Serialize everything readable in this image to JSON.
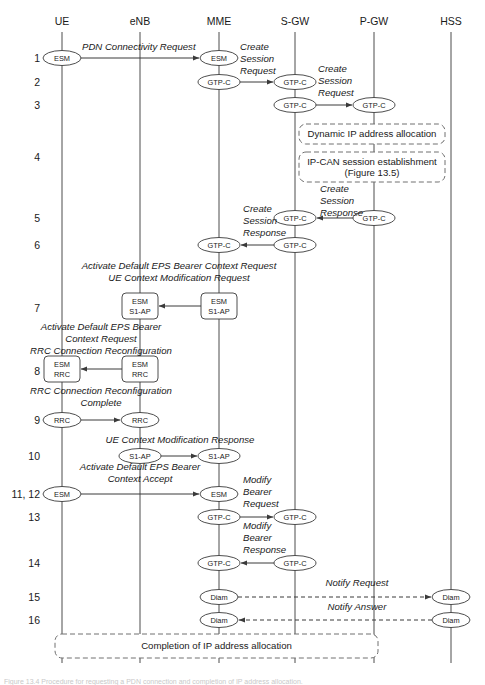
{
  "figure": {
    "caption": "Figure 13.4 Procedure for requesting a PDN connection and completion of IP address allocation.",
    "background_color": "#ffffff",
    "line_color": "#3a3a3a"
  },
  "actors": [
    {
      "id": "ue",
      "label": "UE",
      "x": 62
    },
    {
      "id": "enb",
      "label": "eNB",
      "x": 140
    },
    {
      "id": "mme",
      "label": "MME",
      "x": 219
    },
    {
      "id": "sgw",
      "label": "S-GW",
      "x": 295
    },
    {
      "id": "pgw",
      "label": "P-GW",
      "x": 374
    },
    {
      "id": "hss",
      "label": "HSS",
      "x": 451
    }
  ],
  "steps": [
    {
      "num": "1",
      "y": 58
    },
    {
      "num": "2",
      "y": 82
    },
    {
      "num": "3",
      "y": 105
    },
    {
      "num": "4",
      "y": 157
    },
    {
      "num": "5",
      "y": 218
    },
    {
      "num": "6",
      "y": 245
    },
    {
      "num": "7",
      "y": 308
    },
    {
      "num": "8",
      "y": 371
    },
    {
      "num": "9",
      "y": 420
    },
    {
      "num": "10",
      "y": 456
    },
    {
      "num": "11, 12",
      "y": 494
    },
    {
      "num": "13",
      "y": 517
    },
    {
      "num": "14",
      "y": 563
    },
    {
      "num": "15",
      "y": 597
    },
    {
      "num": "16",
      "y": 620
    }
  ],
  "messages": [
    {
      "id": "m1",
      "step": "1",
      "label": "PDN Connectivity Request",
      "label_lines": [
        "PDN Connectivity Request"
      ],
      "from": "ue",
      "to": "mme",
      "from_node": "ESM",
      "to_node": "ESM",
      "node_shape": "ellipse",
      "line": "solid",
      "direction": "right"
    },
    {
      "id": "m2",
      "step": "2",
      "label": "Create Session Request",
      "label_lines": [
        "Create",
        "Session",
        "Request"
      ],
      "from": "mme",
      "to": "sgw",
      "from_node": "GTP-C",
      "to_node": "GTP-C",
      "node_shape": "ellipse",
      "line": "solid",
      "direction": "right"
    },
    {
      "id": "m3",
      "step": "3",
      "label": "Create Session Request",
      "label_lines": [
        "Create",
        "Session",
        "Request"
      ],
      "from": "sgw",
      "to": "pgw",
      "from_node": "GTP-C",
      "to_node": "GTP-C",
      "node_shape": "ellipse",
      "line": "solid",
      "direction": "right"
    },
    {
      "id": "m5",
      "step": "5",
      "label": "Create Session Response",
      "label_lines": [
        "Create",
        "Session",
        "Response"
      ],
      "from": "pgw",
      "to": "sgw",
      "from_node": "GTP-C",
      "to_node": "GTP-C",
      "node_shape": "ellipse",
      "line": "solid",
      "direction": "left"
    },
    {
      "id": "m6",
      "step": "6",
      "label": "Create Session Response",
      "label_lines": [
        "Create",
        "Session",
        "Response"
      ],
      "from": "sgw",
      "to": "mme",
      "from_node": "GTP-C",
      "to_node": "GTP-C",
      "node_shape": "ellipse",
      "line": "solid",
      "direction": "left"
    },
    {
      "id": "m7",
      "step": "7",
      "label": "Activate Default EPS Bearer Context Request / UE Context Modification Request",
      "label_lines": [
        "Activate Default EPS Bearer Context Request",
        "UE Context Modification Request"
      ],
      "from": "mme",
      "to": "enb",
      "from_node": "ESM\nS1-AP",
      "to_node": "ESM\nS1-AP",
      "node_shape": "rounded-rect",
      "line": "solid",
      "direction": "left"
    },
    {
      "id": "m8",
      "step": "8",
      "label": "Activate Default EPS Bearer Context Request / RRC Connection Reconfiguration",
      "label_lines": [
        "Activate Default EPS Bearer",
        "Context Request",
        "RRC Connection Reconfiguration"
      ],
      "from": "enb",
      "to": "ue",
      "from_node": "ESM\nRRC",
      "to_node": "ESM\nRRC",
      "node_shape": "rounded-rect",
      "line": "solid",
      "direction": "left"
    },
    {
      "id": "m9",
      "step": "9",
      "label": "RRC Connection Reconfiguration Complete",
      "label_lines": [
        "RRC Connection Reconfiguration",
        "Complete"
      ],
      "from": "ue",
      "to": "enb",
      "from_node": "RRC",
      "to_node": "RRC",
      "node_shape": "ellipse",
      "line": "solid",
      "direction": "right"
    },
    {
      "id": "m10",
      "step": "10",
      "label": "UE Context Modification Response",
      "label_lines": [
        "UE Context Modification Response"
      ],
      "from": "enb",
      "to": "mme",
      "from_node": "S1-AP",
      "to_node": "S1-AP",
      "node_shape": "ellipse",
      "line": "solid",
      "direction": "right"
    },
    {
      "id": "m11",
      "step": "11, 12",
      "label": "Activate Default EPS Bearer Context Accept",
      "label_lines": [
        "Activate Default EPS Bearer",
        "Context Accept"
      ],
      "from": "ue",
      "to": "mme",
      "from_node": "ESM",
      "to_node": "ESM",
      "node_shape": "ellipse",
      "line": "solid",
      "direction": "right"
    },
    {
      "id": "m13",
      "step": "13",
      "label": "Modify Bearer Request",
      "label_lines": [
        "Modify",
        "Bearer",
        "Request"
      ],
      "from": "mme",
      "to": "sgw",
      "from_node": "GTP-C",
      "to_node": "GTP-C",
      "node_shape": "ellipse",
      "line": "solid",
      "direction": "right"
    },
    {
      "id": "m14",
      "step": "14",
      "label": "Modify Bearer Response",
      "label_lines": [
        "Modify",
        "Bearer",
        "Response"
      ],
      "from": "sgw",
      "to": "mme",
      "from_node": "GTP-C",
      "to_node": "GTP-C",
      "node_shape": "ellipse",
      "line": "solid",
      "direction": "left"
    },
    {
      "id": "m15",
      "step": "15",
      "label": "Notify Request",
      "label_lines": [
        "Notify Request"
      ],
      "from": "mme",
      "to": "hss",
      "from_node": "Diam",
      "to_node": "Diam",
      "node_shape": "ellipse",
      "line": "dashed",
      "direction": "right"
    },
    {
      "id": "m16",
      "step": "16",
      "label": "Notify Answer",
      "label_lines": [
        "Notify Answer"
      ],
      "from": "hss",
      "to": "mme",
      "from_node": "Diam",
      "to_node": "Diam",
      "node_shape": "ellipse",
      "line": "dashed",
      "direction": "left"
    }
  ],
  "dashed_boxes": [
    {
      "id": "box-dynamic-ip",
      "lines": [
        "Dynamic IP address allocation"
      ],
      "x": 299,
      "y": 124,
      "width": 146,
      "height": 20
    },
    {
      "id": "box-ipcan",
      "lines": [
        "IP-CAN session establishment",
        "(Figure 13.5)"
      ],
      "x": 299,
      "y": 152,
      "width": 146,
      "height": 30
    },
    {
      "id": "box-completion",
      "lines": [
        "Completion of IP address allocation"
      ],
      "x": 55,
      "y": 634,
      "width": 323,
      "height": 24
    }
  ],
  "inline_labels": [
    {
      "id": "lbl-m1",
      "text": "PDN Connectivity Request",
      "x": 82,
      "y": 50,
      "anchor": "start"
    },
    {
      "id": "lbl-m2a",
      "text": "Create",
      "x": 240,
      "y": 50,
      "anchor": "start"
    },
    {
      "id": "lbl-m2b",
      "text": "Session",
      "x": 240,
      "y": 62,
      "anchor": "start"
    },
    {
      "id": "lbl-m2c",
      "text": "Request",
      "x": 240,
      "y": 74,
      "anchor": "start"
    },
    {
      "id": "lbl-m3a",
      "text": "Create",
      "x": 318,
      "y": 72,
      "anchor": "start"
    },
    {
      "id": "lbl-m3b",
      "text": "Session",
      "x": 318,
      "y": 84,
      "anchor": "start"
    },
    {
      "id": "lbl-m3c",
      "text": "Request",
      "x": 318,
      "y": 96,
      "anchor": "start"
    },
    {
      "id": "lbl-m5a",
      "text": "Create",
      "x": 320,
      "y": 192,
      "anchor": "start"
    },
    {
      "id": "lbl-m5b",
      "text": "Session",
      "x": 320,
      "y": 204,
      "anchor": "start"
    },
    {
      "id": "lbl-m5c",
      "text": "Response",
      "x": 320,
      "y": 216,
      "anchor": "start"
    },
    {
      "id": "lbl-m6a",
      "text": "Create",
      "x": 243,
      "y": 212,
      "anchor": "start"
    },
    {
      "id": "lbl-m6b",
      "text": "Session",
      "x": 243,
      "y": 224,
      "anchor": "start"
    },
    {
      "id": "lbl-m6c",
      "text": "Response",
      "x": 243,
      "y": 236,
      "anchor": "start"
    },
    {
      "id": "lbl-m7a",
      "text": "Activate Default EPS Bearer Context Request",
      "x": 179,
      "y": 269,
      "anchor": "middle"
    },
    {
      "id": "lbl-m7b",
      "text": "UE Context Modification Request",
      "x": 179,
      "y": 281,
      "anchor": "middle"
    },
    {
      "id": "lbl-m8a",
      "text": "Activate Default EPS Bearer",
      "x": 101,
      "y": 330,
      "anchor": "middle"
    },
    {
      "id": "lbl-m8b",
      "text": "Context Request",
      "x": 101,
      "y": 342,
      "anchor": "middle"
    },
    {
      "id": "lbl-m8c",
      "text": "RRC Connection Reconfiguration",
      "x": 101,
      "y": 354,
      "anchor": "middle"
    },
    {
      "id": "lbl-m9a",
      "text": "RRC Connection Reconfiguration",
      "x": 101,
      "y": 394,
      "anchor": "middle"
    },
    {
      "id": "lbl-m9b",
      "text": "Complete",
      "x": 101,
      "y": 406,
      "anchor": "middle"
    },
    {
      "id": "lbl-m10",
      "text": "UE Context Modification Response",
      "x": 180,
      "y": 443,
      "anchor": "middle"
    },
    {
      "id": "lbl-m11a",
      "text": "Activate Default EPS Bearer",
      "x": 140,
      "y": 470,
      "anchor": "middle"
    },
    {
      "id": "lbl-m11b",
      "text": "Context Accept",
      "x": 140,
      "y": 482,
      "anchor": "middle"
    },
    {
      "id": "lbl-m13a",
      "text": "Modify",
      "x": 243,
      "y": 483,
      "anchor": "start"
    },
    {
      "id": "lbl-m13b",
      "text": "Bearer",
      "x": 243,
      "y": 495,
      "anchor": "start"
    },
    {
      "id": "lbl-m13c",
      "text": "Request",
      "x": 243,
      "y": 507,
      "anchor": "start"
    },
    {
      "id": "lbl-m14a",
      "text": "Modify",
      "x": 243,
      "y": 529,
      "anchor": "start"
    },
    {
      "id": "lbl-m14b",
      "text": "Bearer",
      "x": 243,
      "y": 541,
      "anchor": "start"
    },
    {
      "id": "lbl-m14c",
      "text": "Response",
      "x": 243,
      "y": 553,
      "anchor": "start"
    },
    {
      "id": "lbl-m15",
      "text": "Notify Request",
      "x": 357,
      "y": 586,
      "anchor": "middle"
    },
    {
      "id": "lbl-m16",
      "text": "Notify Answer",
      "x": 357,
      "y": 610,
      "anchor": "middle"
    }
  ],
  "nodes": [
    {
      "id": "n1-ue",
      "shape": "ellipse",
      "lines": [
        "ESM"
      ],
      "x": 62,
      "y": 58
    },
    {
      "id": "n1-mme",
      "shape": "ellipse",
      "lines": [
        "ESM"
      ],
      "x": 219,
      "y": 58
    },
    {
      "id": "n2-mme",
      "shape": "ellipse",
      "lines": [
        "GTP-C"
      ],
      "x": 219,
      "y": 82
    },
    {
      "id": "n2-sgw",
      "shape": "ellipse",
      "lines": [
        "GTP-C"
      ],
      "x": 295,
      "y": 82
    },
    {
      "id": "n3-sgw",
      "shape": "ellipse",
      "lines": [
        "GTP-C"
      ],
      "x": 295,
      "y": 105
    },
    {
      "id": "n3-pgw",
      "shape": "ellipse",
      "lines": [
        "GTP-C"
      ],
      "x": 374,
      "y": 105
    },
    {
      "id": "n5-pgw",
      "shape": "ellipse",
      "lines": [
        "GTP-C"
      ],
      "x": 374,
      "y": 218
    },
    {
      "id": "n5-sgw",
      "shape": "ellipse",
      "lines": [
        "GTP-C"
      ],
      "x": 295,
      "y": 218
    },
    {
      "id": "n6-sgw",
      "shape": "ellipse",
      "lines": [
        "GTP-C"
      ],
      "x": 295,
      "y": 245
    },
    {
      "id": "n6-mme",
      "shape": "ellipse",
      "lines": [
        "GTP-C"
      ],
      "x": 219,
      "y": 245
    },
    {
      "id": "n7-mme",
      "shape": "rect",
      "lines": [
        "ESM",
        "S1-AP"
      ],
      "x": 219,
      "y": 306
    },
    {
      "id": "n7-enb",
      "shape": "rect",
      "lines": [
        "ESM",
        "S1-AP"
      ],
      "x": 140,
      "y": 306
    },
    {
      "id": "n8-enb",
      "shape": "rect",
      "lines": [
        "ESM",
        "RRC"
      ],
      "x": 140,
      "y": 369
    },
    {
      "id": "n8-ue",
      "shape": "rect",
      "lines": [
        "ESM",
        "RRC"
      ],
      "x": 62,
      "y": 369
    },
    {
      "id": "n9-ue",
      "shape": "ellipse",
      "lines": [
        "RRC"
      ],
      "x": 62,
      "y": 420
    },
    {
      "id": "n9-enb",
      "shape": "ellipse",
      "lines": [
        "RRC"
      ],
      "x": 140,
      "y": 420
    },
    {
      "id": "n10-enb",
      "shape": "ellipse",
      "lines": [
        "S1-AP"
      ],
      "x": 140,
      "y": 456
    },
    {
      "id": "n10-mme",
      "shape": "ellipse",
      "lines": [
        "S1-AP"
      ],
      "x": 219,
      "y": 456
    },
    {
      "id": "n11-ue",
      "shape": "ellipse",
      "lines": [
        "ESM"
      ],
      "x": 62,
      "y": 494
    },
    {
      "id": "n11-mme",
      "shape": "ellipse",
      "lines": [
        "ESM"
      ],
      "x": 219,
      "y": 494
    },
    {
      "id": "n13-mme",
      "shape": "ellipse",
      "lines": [
        "GTP-C"
      ],
      "x": 219,
      "y": 517
    },
    {
      "id": "n13-sgw",
      "shape": "ellipse",
      "lines": [
        "GTP-C"
      ],
      "x": 295,
      "y": 517
    },
    {
      "id": "n14-sgw",
      "shape": "ellipse",
      "lines": [
        "GTP-C"
      ],
      "x": 295,
      "y": 563
    },
    {
      "id": "n14-mme",
      "shape": "ellipse",
      "lines": [
        "GTP-C"
      ],
      "x": 219,
      "y": 563
    },
    {
      "id": "n15-mme",
      "shape": "ellipse",
      "lines": [
        "Diam"
      ],
      "x": 219,
      "y": 597
    },
    {
      "id": "n15-hss",
      "shape": "ellipse",
      "lines": [
        "Diam"
      ],
      "x": 451,
      "y": 597
    },
    {
      "id": "n16-mme",
      "shape": "ellipse",
      "lines": [
        "Diam"
      ],
      "x": 219,
      "y": 620
    },
    {
      "id": "n16-hss",
      "shape": "ellipse",
      "lines": [
        "Diam"
      ],
      "x": 451,
      "y": 620
    }
  ]
}
